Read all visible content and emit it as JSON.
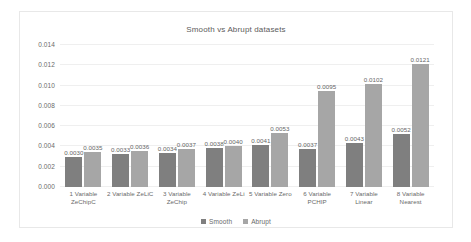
{
  "chart_data": {
    "type": "bar",
    "title": "Smooth vs Abrupt datasets",
    "xlabel": "",
    "ylabel": "",
    "ylim": [
      0,
      0.014
    ],
    "yticks": [
      "0.000",
      "0.002",
      "0.004",
      "0.006",
      "0.008",
      "0.010",
      "0.012",
      "0.014"
    ],
    "ytick_values": [
      0,
      0.002,
      0.004,
      0.006,
      0.008,
      0.01,
      0.012,
      0.014
    ],
    "grid": true,
    "legend_position": "bottom",
    "categories": [
      "1 Variable ZeChipC",
      "2 Variable ZeLiC",
      "3 Variable ZeChip",
      "4 Variable ZeLi",
      "5 Variable Zero",
      "6 Variable PCHIP",
      "7 Variable Linear",
      "8 Variable Nearest"
    ],
    "series": [
      {
        "name": "Smooth",
        "color": "#7f7f7f",
        "values": [
          0.003,
          0.0033,
          0.0034,
          0.0038,
          0.0041,
          0.0037,
          0.0043,
          0.0052
        ],
        "labels": [
          "0.0030",
          "0.0033",
          "0.0034",
          "0.0038",
          "0.0041",
          "0.0037",
          "0.0043",
          "0.0052"
        ]
      },
      {
        "name": "Abrupt",
        "color": "#a6a6a6",
        "values": [
          0.0035,
          0.0036,
          0.0037,
          0.004,
          0.0053,
          0.0095,
          0.0102,
          0.0121
        ],
        "labels": [
          "0.0035",
          "0.0036",
          "0.0037",
          "0.0040",
          "0.0053",
          "0.0095",
          "0.0102",
          "0.0121"
        ]
      }
    ]
  }
}
